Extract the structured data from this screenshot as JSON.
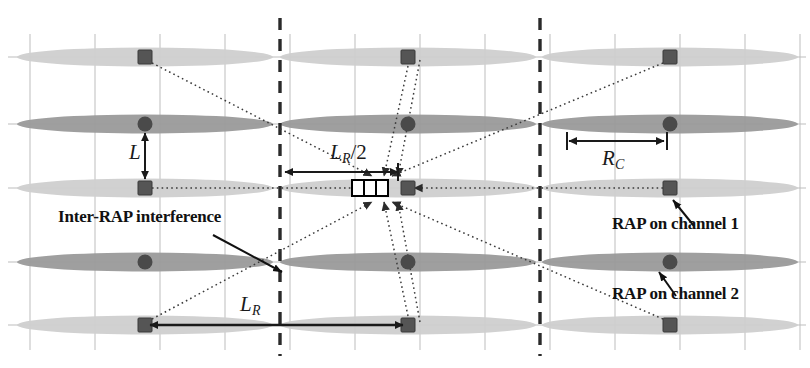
{
  "figure": {
    "type": "road-network-cellular-layout-diagram",
    "background_color": "#ffffff",
    "width": 810,
    "height": 368
  },
  "colors": {
    "grid_line": "#b9b9b9",
    "dashed_boundary": "#2a2a2a",
    "road_light": "#cfcfcf",
    "road_dark": "#9a9a9a",
    "rap_square": "#555555",
    "rap_circle": "#4a4a4a",
    "interference_line": "#3a3a3a",
    "dimension_line": "#1a1a1a",
    "text": "#111111",
    "vehicle_fill": "#ffffff",
    "vehicle_stroke": "#000000"
  },
  "labels": {
    "inter_rap_interference": "Inter-RAP interference",
    "rap_channel_1": "RAP on channel 1",
    "rap_channel_2": "RAP on channel 2"
  },
  "dimensions": [
    {
      "id": "L",
      "symbol": "L",
      "subscript": "",
      "orientation": "vertical",
      "description": "spacing between adjacent roads"
    },
    {
      "id": "LR_half",
      "symbol": "L",
      "subscript": "R",
      "suffix": "/2",
      "orientation": "horizontal",
      "description": "half the RAP spacing along a road"
    },
    {
      "id": "LR",
      "symbol": "L",
      "subscript": "R",
      "orientation": "horizontal",
      "description": "RAP spacing along a road"
    },
    {
      "id": "RC",
      "symbol": "R",
      "subscript": "C",
      "orientation": "horizontal",
      "description": "cell radius / coverage radius"
    }
  ],
  "rows": [
    {
      "index": 0,
      "y": 57,
      "road_shade": "light",
      "rap_type": "square",
      "rap_channel": 1
    },
    {
      "index": 1,
      "y": 124,
      "road_shade": "dark",
      "rap_type": "circle",
      "rap_channel": 2
    },
    {
      "index": 2,
      "y": 188,
      "road_shade": "light",
      "rap_type": "square",
      "rap_channel": 1
    },
    {
      "index": 3,
      "y": 262,
      "road_shade": "dark",
      "rap_type": "circle",
      "rap_channel": 2
    },
    {
      "index": 4,
      "y": 325,
      "road_shade": "light",
      "rap_type": "square",
      "rap_channel": 1
    }
  ],
  "rap_columns_x": [
    145,
    408,
    670
  ],
  "vertical_gridlines_x": [
    30,
    95,
    160,
    225,
    290,
    355,
    420,
    485,
    550,
    615,
    680,
    745,
    800
  ],
  "dashed_boundaries_x": [
    280,
    540
  ],
  "vehicle": {
    "label": "vehicle-receiver",
    "x": 370,
    "y": 188,
    "width": 36,
    "height": 16
  },
  "legend_arrows": [
    {
      "from_label": "inter_rap_interference",
      "points_to": "interference-path"
    },
    {
      "from_label": "rap_channel_1",
      "points_to": "rap-square-top-right"
    },
    {
      "from_label": "rap_channel_2",
      "points_to": "rap-circle-mid-right"
    }
  ]
}
